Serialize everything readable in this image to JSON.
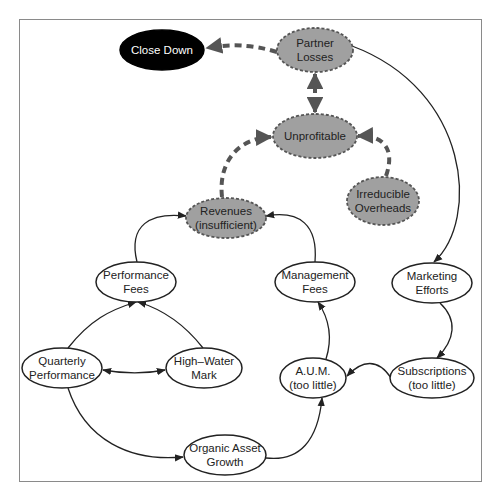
{
  "diagram": {
    "type": "causal-loop",
    "colors": {
      "frame": "#8a8a8a",
      "solid_node_fill": "#ffffff",
      "problem_node_fill": "#a0a0a0",
      "terminal_node_fill": "#000000",
      "edge": "#222222",
      "dashed_edge": "#555555"
    },
    "nodes": [
      {
        "id": "close_down",
        "lines": [
          "Close Down"
        ],
        "style": "terminal",
        "cx": 162,
        "cy": 50,
        "rx": 42,
        "ry": 20
      },
      {
        "id": "partner_losses",
        "lines": [
          "Partner",
          "Losses"
        ],
        "style": "problem",
        "cx": 315,
        "cy": 50,
        "rx": 38,
        "ry": 22
      },
      {
        "id": "unprofitable",
        "lines": [
          "Unprofitable"
        ],
        "style": "problem",
        "cx": 315,
        "cy": 136,
        "rx": 42,
        "ry": 22
      },
      {
        "id": "irreducible_overheads",
        "lines": [
          "Irreducible",
          "Overheads"
        ],
        "style": "problem",
        "cx": 383,
        "cy": 201,
        "rx": 36,
        "ry": 24
      },
      {
        "id": "revenues",
        "lines": [
          "Revenues",
          "(insufficient)"
        ],
        "style": "problem",
        "cx": 226,
        "cy": 218,
        "rx": 40,
        "ry": 20
      },
      {
        "id": "performance_fees",
        "lines": [
          "Performance",
          "Fees"
        ],
        "style": "normal",
        "cx": 136,
        "cy": 282,
        "rx": 40,
        "ry": 20
      },
      {
        "id": "management_fees",
        "lines": [
          "Management",
          "Fees"
        ],
        "style": "normal",
        "cx": 315,
        "cy": 282,
        "rx": 40,
        "ry": 20
      },
      {
        "id": "marketing_efforts",
        "lines": [
          "Marketing",
          "Efforts"
        ],
        "style": "normal",
        "cx": 432,
        "cy": 283,
        "rx": 40,
        "ry": 20
      },
      {
        "id": "quarterly_performance",
        "lines": [
          "Quarterly",
          "Performance"
        ],
        "style": "normal",
        "cx": 62,
        "cy": 368,
        "rx": 40,
        "ry": 20
      },
      {
        "id": "high_water_mark",
        "lines": [
          "High–Water",
          "Mark"
        ],
        "style": "normal",
        "cx": 204,
        "cy": 368,
        "rx": 38,
        "ry": 20
      },
      {
        "id": "aum",
        "lines": [
          "A.U.M.",
          "(too little)"
        ],
        "style": "normal",
        "cx": 313,
        "cy": 378,
        "rx": 33,
        "ry": 20
      },
      {
        "id": "subscriptions",
        "lines": [
          "Subscriptions",
          "(too little)"
        ],
        "style": "normal",
        "cx": 432,
        "cy": 378,
        "rx": 42,
        "ry": 20
      },
      {
        "id": "organic_asset_growth",
        "lines": [
          "Organic Asset",
          "Growth"
        ],
        "style": "normal",
        "cx": 225,
        "cy": 455,
        "rx": 41,
        "ry": 20
      }
    ],
    "edges": [
      {
        "from": "partner_losses",
        "to": "close_down",
        "style": "dashed",
        "direction": "forward"
      },
      {
        "from": "partner_losses",
        "to": "unprofitable",
        "style": "dashed",
        "direction": "both"
      },
      {
        "from": "revenues",
        "to": "unprofitable",
        "style": "dashed",
        "direction": "forward"
      },
      {
        "from": "irreducible_overheads",
        "to": "unprofitable",
        "style": "dashed",
        "direction": "forward"
      },
      {
        "from": "partner_losses",
        "to": "marketing_efforts",
        "style": "solid",
        "direction": "forward"
      },
      {
        "from": "performance_fees",
        "to": "revenues",
        "style": "solid",
        "direction": "forward"
      },
      {
        "from": "management_fees",
        "to": "revenues",
        "style": "solid",
        "direction": "forward"
      },
      {
        "from": "quarterly_performance",
        "to": "performance_fees",
        "style": "solid",
        "direction": "forward"
      },
      {
        "from": "high_water_mark",
        "to": "performance_fees",
        "style": "solid",
        "direction": "forward"
      },
      {
        "from": "quarterly_performance",
        "to": "high_water_mark",
        "style": "solid",
        "direction": "both"
      },
      {
        "from": "quarterly_performance",
        "to": "organic_asset_growth",
        "style": "solid",
        "direction": "forward"
      },
      {
        "from": "organic_asset_growth",
        "to": "aum",
        "style": "solid",
        "direction": "forward"
      },
      {
        "from": "aum",
        "to": "management_fees",
        "style": "solid",
        "direction": "forward"
      },
      {
        "from": "marketing_efforts",
        "to": "subscriptions",
        "style": "solid",
        "direction": "forward"
      },
      {
        "from": "subscriptions",
        "to": "aum",
        "style": "solid",
        "direction": "forward"
      }
    ]
  }
}
